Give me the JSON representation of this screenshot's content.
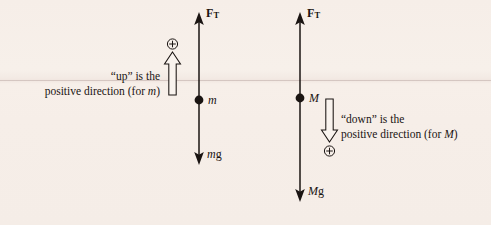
{
  "figure": {
    "type": "free-body-diagram",
    "background_color": "#f6eee8",
    "ink_color": "#1a1412"
  },
  "left_diagram": {
    "name": "free-body-diagram-mass-m",
    "tension_label": {
      "symbol": "F",
      "subscript": "T"
    },
    "mass_label": "m",
    "weight_label": {
      "mass": "m",
      "gravity": "g"
    },
    "sign_symbol": "+",
    "convention_direction": "up",
    "caption_line1": "“up” is the",
    "caption_line2_prefix": "positive direction (for ",
    "caption_line2_italic": "m",
    "caption_line2_suffix": ")"
  },
  "right_diagram": {
    "name": "free-body-diagram-mass-M",
    "tension_label": {
      "symbol": "F",
      "subscript": "T"
    },
    "mass_label": "M",
    "weight_label": {
      "mass": "M",
      "gravity": "g"
    },
    "sign_symbol": "+",
    "convention_direction": "down",
    "caption_line1": "“down” is the",
    "caption_line2_prefix": "positive direction (for ",
    "caption_line2_italic": "M",
    "caption_line2_suffix": ")"
  }
}
